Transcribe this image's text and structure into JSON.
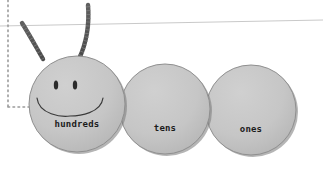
{
  "figure": {
    "background_color": "#ffffff"
  },
  "palette": {
    "circle_fill": "#c3c3c3",
    "circle_fill_light": "#cfcfcf",
    "circle_edge": "#8f8f8f",
    "circle_shadow": "#6e6e6e",
    "antenna": "#555555",
    "face_line": "#3a3a3a",
    "label_text": "#1c1c1c",
    "guide_line": "#c9c9c9",
    "dotted_guide": "#9a9a9a"
  },
  "segments": [
    {
      "id": "hundreds",
      "label": "hundreds",
      "cx": 77,
      "cy": 104,
      "r": 48,
      "label_x": 77,
      "label_y": 124,
      "has_face": true
    },
    {
      "id": "tens",
      "label": "tens",
      "cx": 165,
      "cy": 109,
      "r": 45,
      "label_x": 165,
      "label_y": 128,
      "has_face": false
    },
    {
      "id": "ones",
      "label": "ones",
      "cx": 251,
      "cy": 110,
      "r": 45,
      "label_x": 251,
      "label_y": 129,
      "has_face": false
    }
  ],
  "face": {
    "left_eye": {
      "cx": 56,
      "cy": 85,
      "rx": 2.2,
      "ry": 4.6
    },
    "right_eye": {
      "cx": 75,
      "cy": 85,
      "rx": 2.2,
      "ry": 4.6
    },
    "smile_path": "M 37 98 C 39 115, 62 117, 70 116 C 80 116, 101 113, 103 98"
  },
  "antennae": [
    {
      "id": "left-antenna",
      "path": "M 43 59 C 36 47, 29 34, 22 23",
      "tip_x": 22,
      "tip_y": 23
    },
    {
      "id": "right-antenna",
      "path": "M 79 59 C 85 46, 90 30, 88 5",
      "tip_x": 88,
      "tip_y": 5
    }
  ],
  "guides": {
    "horizon_line": {
      "x1": 0,
      "y1": 26,
      "x2": 323,
      "y2": 20
    },
    "vertical_dotted": {
      "x": 8,
      "y1": 0,
      "y2": 107
    },
    "horizontal_dotted": {
      "y": 107,
      "x1": 8,
      "x2": 30
    }
  }
}
